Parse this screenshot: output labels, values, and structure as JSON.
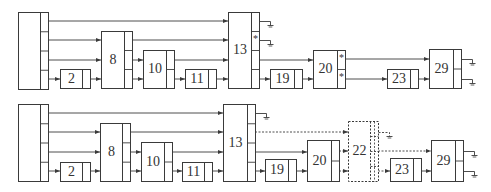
{
  "diagrams": [
    {
      "id": "top",
      "blocks": [
        {
          "id": "src",
          "label": "",
          "x": 18,
          "y": 12,
          "w": 30,
          "h": 77,
          "ports": 4,
          "portSide": "right",
          "dashed": false
        },
        {
          "id": "b2",
          "label": "2",
          "x": 60,
          "y": 69,
          "w": 30,
          "h": 19,
          "ports": 1,
          "portSide": "right",
          "dashed": false
        },
        {
          "id": "b8",
          "label": "8",
          "x": 101,
          "y": 31,
          "w": 31,
          "h": 57,
          "ports": 3,
          "portSide": "right",
          "dashed": false
        },
        {
          "id": "b10",
          "label": "10",
          "x": 143,
          "y": 50,
          "w": 31,
          "h": 38,
          "ports": 2,
          "portSide": "right",
          "dashed": false
        },
        {
          "id": "b11",
          "label": "11",
          "x": 185,
          "y": 69,
          "w": 31,
          "h": 19,
          "ports": 1,
          "portSide": "right",
          "dashed": false
        },
        {
          "id": "b13",
          "label": "13",
          "x": 228,
          "y": 12,
          "w": 31,
          "h": 76,
          "ports": 4,
          "portSide": "right",
          "dashed": false,
          "marks": [
            "",
            "*",
            "",
            ""
          ]
        },
        {
          "id": "b19",
          "label": "19",
          "x": 270,
          "y": 69,
          "w": 32,
          "h": 19,
          "ports": 1,
          "portSide": "right",
          "dashed": false
        },
        {
          "id": "b20",
          "label": "20",
          "x": 313,
          "y": 50,
          "w": 32,
          "h": 38,
          "ports": 2,
          "portSide": "right",
          "dashed": false,
          "marks": [
            "*",
            "*"
          ]
        },
        {
          "id": "b23",
          "label": "23",
          "x": 387,
          "y": 69,
          "w": 31,
          "h": 19,
          "ports": 1,
          "portSide": "right",
          "dashed": false
        },
        {
          "id": "b29",
          "label": "29",
          "x": 429,
          "y": 49,
          "w": 32,
          "h": 39,
          "ports": 2,
          "portSide": "right",
          "dashed": false
        }
      ],
      "wires": [
        {
          "pts": [
            [
              48,
              21
            ],
            [
              228,
              21
            ]
          ],
          "arrow": true,
          "dashed": false
        },
        {
          "pts": [
            [
              48,
              40
            ],
            [
              101,
              40
            ]
          ],
          "arrow": true,
          "dashed": false
        },
        {
          "pts": [
            [
              48,
              60
            ],
            [
              101,
              60
            ]
          ],
          "arrow": true,
          "dashed": false
        },
        {
          "pts": [
            [
              48,
              79
            ],
            [
              60,
              79
            ]
          ],
          "arrow": true,
          "dashed": false
        },
        {
          "pts": [
            [
              90,
              79
            ],
            [
              101,
              79
            ]
          ],
          "arrow": true,
          "dashed": false
        },
        {
          "pts": [
            [
              132,
              40
            ],
            [
              228,
              40
            ]
          ],
          "arrow": true,
          "dashed": false
        },
        {
          "pts": [
            [
              132,
              60
            ],
            [
              143,
              60
            ]
          ],
          "arrow": true,
          "dashed": false
        },
        {
          "pts": [
            [
              132,
              79
            ],
            [
              143,
              79
            ]
          ],
          "arrow": true,
          "dashed": false
        },
        {
          "pts": [
            [
              174,
              60
            ],
            [
              228,
              60
            ]
          ],
          "arrow": true,
          "dashed": false
        },
        {
          "pts": [
            [
              174,
              79
            ],
            [
              185,
              79
            ]
          ],
          "arrow": true,
          "dashed": false
        },
        {
          "pts": [
            [
              216,
              79
            ],
            [
              228,
              79
            ]
          ],
          "arrow": true,
          "dashed": false
        },
        {
          "pts": [
            [
              259,
              60
            ],
            [
              313,
              60
            ]
          ],
          "arrow": true,
          "dashed": false
        },
        {
          "pts": [
            [
              259,
              79
            ],
            [
              270,
              79
            ]
          ],
          "arrow": true,
          "dashed": false
        },
        {
          "pts": [
            [
              302,
              79
            ],
            [
              313,
              79
            ]
          ],
          "arrow": true,
          "dashed": false
        },
        {
          "pts": [
            [
              345,
              59
            ],
            [
              429,
              59
            ]
          ],
          "arrow": true,
          "dashed": false
        },
        {
          "pts": [
            [
              345,
              79
            ],
            [
              387,
              79
            ]
          ],
          "arrow": true,
          "dashed": false
        },
        {
          "pts": [
            [
              418,
              79
            ],
            [
              429,
              79
            ]
          ],
          "arrow": true,
          "dashed": false
        }
      ],
      "grounds": [
        {
          "x": 259,
          "y": 21,
          "dashed": false
        },
        {
          "x": 259,
          "y": 40,
          "dashed": false
        },
        {
          "x": 461,
          "y": 59,
          "dashed": false
        },
        {
          "x": 461,
          "y": 79,
          "dashed": false
        }
      ]
    },
    {
      "id": "bottom",
      "blocks": [
        {
          "id": "src",
          "label": "",
          "x": 18,
          "y": 104,
          "w": 30,
          "h": 77,
          "ports": 4,
          "portSide": "right",
          "dashed": false
        },
        {
          "id": "b2",
          "label": "2",
          "x": 60,
          "y": 162,
          "w": 30,
          "h": 19,
          "ports": 1,
          "portSide": "right",
          "dashed": false
        },
        {
          "id": "b8",
          "label": "8",
          "x": 100,
          "y": 123,
          "w": 30,
          "h": 58,
          "ports": 3,
          "portSide": "right",
          "dashed": false
        },
        {
          "id": "b10",
          "label": "10",
          "x": 141,
          "y": 142,
          "w": 31,
          "h": 39,
          "ports": 2,
          "portSide": "right",
          "dashed": false
        },
        {
          "id": "b11",
          "label": "11",
          "x": 182,
          "y": 162,
          "w": 30,
          "h": 19,
          "ports": 1,
          "portSide": "right",
          "dashed": false
        },
        {
          "id": "b13",
          "label": "13",
          "x": 223,
          "y": 104,
          "w": 32,
          "h": 77,
          "ports": 4,
          "portSide": "right",
          "dashed": false
        },
        {
          "id": "b19",
          "label": "19",
          "x": 265,
          "y": 159,
          "w": 31,
          "h": 22,
          "ports": 1,
          "portSide": "right",
          "dashed": false
        },
        {
          "id": "b20",
          "label": "20",
          "x": 307,
          "y": 140,
          "w": 32,
          "h": 41,
          "ports": 2,
          "portSide": "right",
          "dashed": false
        },
        {
          "id": "b22",
          "label": "22",
          "x": 348,
          "y": 121,
          "w": 30,
          "h": 60,
          "ports": 4,
          "portSide": "right",
          "dashed": true
        },
        {
          "id": "b23",
          "label": "23",
          "x": 390,
          "y": 158,
          "w": 31,
          "h": 23,
          "ports": 1,
          "portSide": "right",
          "dashed": false
        },
        {
          "id": "b29",
          "label": "29",
          "x": 431,
          "y": 140,
          "w": 32,
          "h": 41,
          "ports": 2,
          "portSide": "right",
          "dashed": false
        }
      ],
      "wires": [
        {
          "pts": [
            [
              48,
              113
            ],
            [
              223,
              113
            ]
          ],
          "arrow": true,
          "dashed": false
        },
        {
          "pts": [
            [
              48,
              132
            ],
            [
              100,
              132
            ]
          ],
          "arrow": true,
          "dashed": false
        },
        {
          "pts": [
            [
              48,
              152
            ],
            [
              100,
              152
            ]
          ],
          "arrow": true,
          "dashed": false
        },
        {
          "pts": [
            [
              48,
              171
            ],
            [
              60,
              171
            ]
          ],
          "arrow": true,
          "dashed": false
        },
        {
          "pts": [
            [
              90,
              171
            ],
            [
              100,
              171
            ]
          ],
          "arrow": true,
          "dashed": false
        },
        {
          "pts": [
            [
              130,
              132
            ],
            [
              223,
              132
            ]
          ],
          "arrow": true,
          "dashed": false
        },
        {
          "pts": [
            [
              130,
              152
            ],
            [
              141,
              152
            ]
          ],
          "arrow": true,
          "dashed": false
        },
        {
          "pts": [
            [
              130,
              171
            ],
            [
              141,
              171
            ]
          ],
          "arrow": true,
          "dashed": false
        },
        {
          "pts": [
            [
              172,
              152
            ],
            [
              223,
              152
            ]
          ],
          "arrow": true,
          "dashed": false
        },
        {
          "pts": [
            [
              172,
              171
            ],
            [
              182,
              171
            ]
          ],
          "arrow": true,
          "dashed": false
        },
        {
          "pts": [
            [
              212,
              171
            ],
            [
              223,
              171
            ]
          ],
          "arrow": true,
          "dashed": false
        },
        {
          "pts": [
            [
              255,
              132
            ],
            [
              348,
              132
            ]
          ],
          "arrow": true,
          "dashed": true
        },
        {
          "pts": [
            [
              255,
              152
            ],
            [
              307,
              152
            ]
          ],
          "arrow": true,
          "dashed": false
        },
        {
          "pts": [
            [
              255,
              171
            ],
            [
              265,
              171
            ]
          ],
          "arrow": true,
          "dashed": false
        },
        {
          "pts": [
            [
              296,
              171
            ],
            [
              307,
              171
            ]
          ],
          "arrow": true,
          "dashed": false
        },
        {
          "pts": [
            [
              339,
              151
            ],
            [
              348,
              151
            ]
          ],
          "arrow": true,
          "dashed": true
        },
        {
          "pts": [
            [
              339,
              171
            ],
            [
              348,
              171
            ]
          ],
          "arrow": true,
          "dashed": true
        },
        {
          "pts": [
            [
              378,
              151
            ],
            [
              431,
              151
            ]
          ],
          "arrow": true,
          "dashed": true
        },
        {
          "pts": [
            [
              378,
              171
            ],
            [
              390,
              171
            ]
          ],
          "arrow": true,
          "dashed": true
        },
        {
          "pts": [
            [
              421,
              171
            ],
            [
              431,
              171
            ]
          ],
          "arrow": true,
          "dashed": false
        }
      ],
      "grounds": [
        {
          "x": 255,
          "y": 113,
          "dashed": false
        },
        {
          "x": 378,
          "y": 132,
          "dashed": true
        },
        {
          "x": 463,
          "y": 151,
          "dashed": false
        },
        {
          "x": 463,
          "y": 171,
          "dashed": false
        }
      ]
    }
  ],
  "style": {
    "stroke": "#3a3a3a",
    "text": "#333333",
    "background": "#ffffff"
  }
}
